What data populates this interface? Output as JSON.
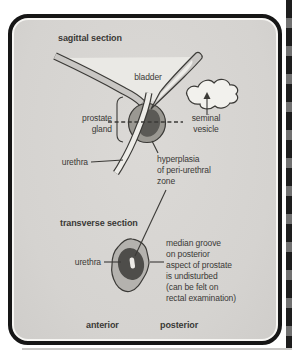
{
  "colors": {
    "panel": "#d7d5d2",
    "bladder_fill": "#eae9e5",
    "tube_fill": "#c9c7c4",
    "tube_lumen": "#edece8",
    "prostate_outer": "#9a9892",
    "prostate_inner": "#5b5a56",
    "vesicle_fill": "#f2f1ed",
    "transverse_outer": "#b4b2ae",
    "transverse_inner": "#4e4d4a",
    "slit_fill": "#eceae6",
    "frame": "#161616",
    "text": "#3a3936",
    "outline": "#3b3a37"
  },
  "sagittal": {
    "heading": "sagittal section",
    "bladder_label": "bladder",
    "prostate_label": [
      "prostate",
      "gland"
    ],
    "seminal_label": [
      "seminal",
      "vesicle"
    ],
    "urethra_label": "urethra",
    "hyperplasia_label": [
      "hyperplasia",
      "of peri-urethral",
      "zone"
    ]
  },
  "transverse": {
    "heading": "transverse section",
    "urethra_label": "urethra",
    "median_groove_label": [
      "median groove",
      "on posterior",
      "aspect of prostate",
      "is undisturbed",
      "(can be felt on",
      "rectal examination)"
    ]
  },
  "footer": {
    "anterior": "anterior",
    "posterior": "posterior"
  }
}
